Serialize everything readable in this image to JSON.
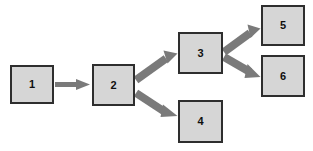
{
  "diagram": {
    "type": "flowchart",
    "title": "",
    "background_color": "#ffffff",
    "node_fill_color": "#d6d6d6",
    "node_border_color": "#2e2e2e",
    "edge_color": "#7a7a7a",
    "label_color": "#0f0f0f",
    "nodes": [
      {
        "id": "n1",
        "label": "1",
        "x": 10,
        "y": 65,
        "w": 44,
        "h": 39
      },
      {
        "id": "n2",
        "label": "2",
        "x": 92,
        "y": 64,
        "w": 43,
        "h": 42
      },
      {
        "id": "n3",
        "label": "3",
        "x": 178,
        "y": 32,
        "w": 45,
        "h": 42
      },
      {
        "id": "n4",
        "label": "4",
        "x": 178,
        "y": 100,
        "w": 45,
        "h": 43
      },
      {
        "id": "n5",
        "label": "5",
        "x": 261,
        "y": 5,
        "w": 44,
        "h": 41
      },
      {
        "id": "n6",
        "label": "6",
        "x": 261,
        "y": 55,
        "w": 44,
        "h": 42
      }
    ],
    "edges": [
      {
        "id": "e1",
        "from": "n1",
        "to": "n2",
        "label": "",
        "style": "thin-arrow"
      },
      {
        "id": "e2",
        "from": "n2",
        "to": "n3",
        "label": "",
        "style": "thick-arrow"
      },
      {
        "id": "e3",
        "from": "n2",
        "to": "n4",
        "label": "",
        "style": "thick-arrow"
      },
      {
        "id": "e4",
        "from": "n3",
        "to": "n5",
        "label": "",
        "style": "thick-arrow"
      },
      {
        "id": "e5",
        "from": "n3",
        "to": "n6",
        "label": "",
        "style": "thick-arrow"
      }
    ]
  }
}
